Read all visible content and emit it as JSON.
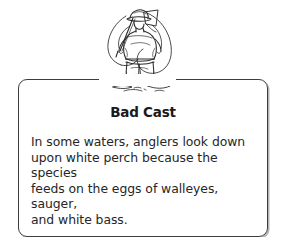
{
  "page": {
    "background_color": "#ffffff"
  },
  "illustration": {
    "name": "angler-wading-line-drawing",
    "alt": "Pen-and-ink drawing of an angler in a hat seen from behind, wading in shallow water with a fishing rod and a large looping cast of line around him",
    "ink_color": "#2b2b2b"
  },
  "card": {
    "title": "Bad Cast",
    "body": "In some waters, anglers look down\nupon white perch because the species\nfeeds on the eggs of walleyes, sauger,\nand white bass.",
    "border_color": "#3d3d3d",
    "shadow_color": "#787878",
    "title_color": "#1a1a1a",
    "body_color": "#262626"
  }
}
